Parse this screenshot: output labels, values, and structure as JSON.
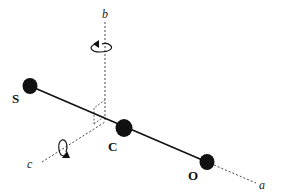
{
  "diagram": {
    "colors": {
      "ink": "#111111",
      "dashed": "#444444",
      "background": "#ffffff"
    },
    "atoms": [
      {
        "id": "S",
        "label": "S",
        "x": 30,
        "y": 86,
        "r": 8
      },
      {
        "id": "C",
        "label": "C",
        "x": 124,
        "y": 128,
        "r": 9
      },
      {
        "id": "O",
        "label": "O",
        "x": 207,
        "y": 162,
        "r": 8
      }
    ],
    "axes": [
      {
        "id": "a",
        "label": "a",
        "style": "dashed"
      },
      {
        "id": "b",
        "label": "b",
        "style": "dashed",
        "rotation_arrow": true
      },
      {
        "id": "c",
        "label": "c",
        "style": "dashed",
        "rotation_arrow": true
      }
    ],
    "bond": {
      "from": "S",
      "to": "O",
      "style": "solid"
    }
  }
}
